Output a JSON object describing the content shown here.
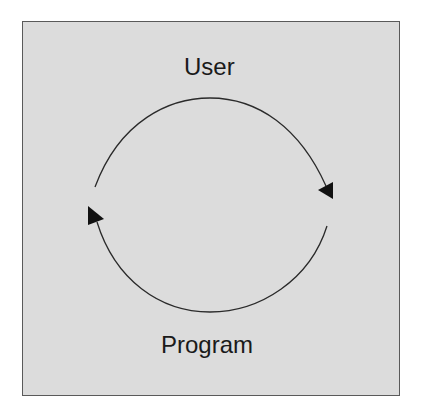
{
  "diagram": {
    "type": "cycle",
    "nodes": [
      {
        "id": "user",
        "label": "User"
      },
      {
        "id": "program",
        "label": "Program"
      }
    ],
    "edges": [
      {
        "from": "program",
        "to": "user",
        "direction": "clockwise-top-arc",
        "arrow_at": "right"
      },
      {
        "from": "user",
        "to": "program",
        "direction": "clockwise-bottom-arc",
        "arrow_at": "left"
      }
    ],
    "colors": {
      "background": "#dcdcdc",
      "border": "#5a5a5a",
      "stroke": "#1a1a1a",
      "text": "#1a1a1a"
    }
  }
}
